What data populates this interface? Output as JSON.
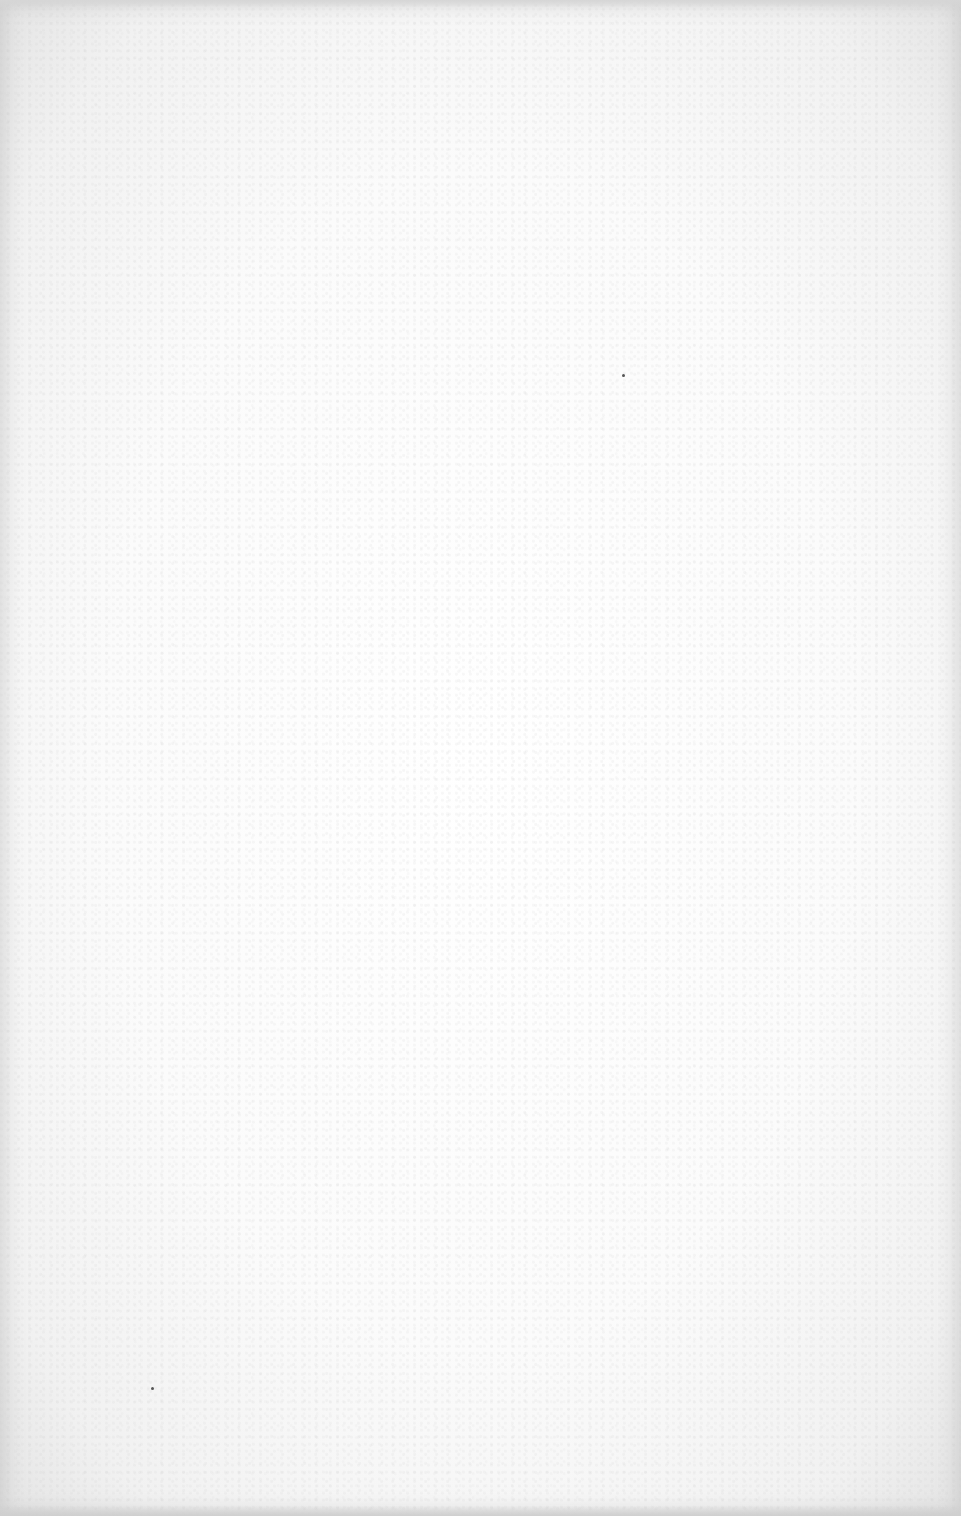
{
  "page": {
    "type": "blank-scanned-page",
    "text": "",
    "background_color": "#fbfbfb",
    "edge_color": "#e0e0e0",
    "specks": [
      {
        "x": 623,
        "y": 375
      },
      {
        "x": 152,
        "y": 1388
      }
    ]
  }
}
